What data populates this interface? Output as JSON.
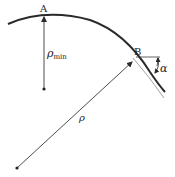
{
  "diagram": {
    "labels": {
      "point_a": "A",
      "point_b": "B",
      "rho_min_symbol": "ρ",
      "rho_min_subscript": "min",
      "rho": "ρ",
      "alpha": "α"
    },
    "colors": {
      "curve": "#2a2a2a",
      "thin_curve": "#8a8a8a",
      "lines": "#3a3a3a",
      "text": "#222222"
    }
  }
}
